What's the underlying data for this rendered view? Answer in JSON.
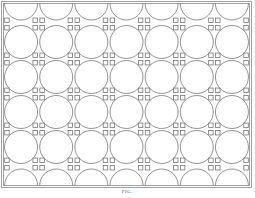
{
  "diagram": {
    "columns": 7,
    "full_circle_rows": 4,
    "top_row": "half-circles (arc downward)",
    "bottom_row": "half-circles (arc upward)",
    "junction_marker": "small square pairs",
    "stroke_color": "#777777",
    "background_color": "#ffffff"
  },
  "caption": "FIG."
}
